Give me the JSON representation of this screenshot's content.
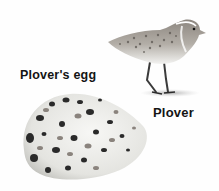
{
  "labels": {
    "egg": "Plover's egg",
    "bird": "Plover"
  },
  "colors": {
    "background": "#fefefe",
    "text": "#141414",
    "egg_shell": "#e9e9e6",
    "speckle_dark": "#2a2a2a",
    "speckle_mid": "#7a7470",
    "bird_back": "#8a8680",
    "bird_belly": "#f2f2f0"
  }
}
